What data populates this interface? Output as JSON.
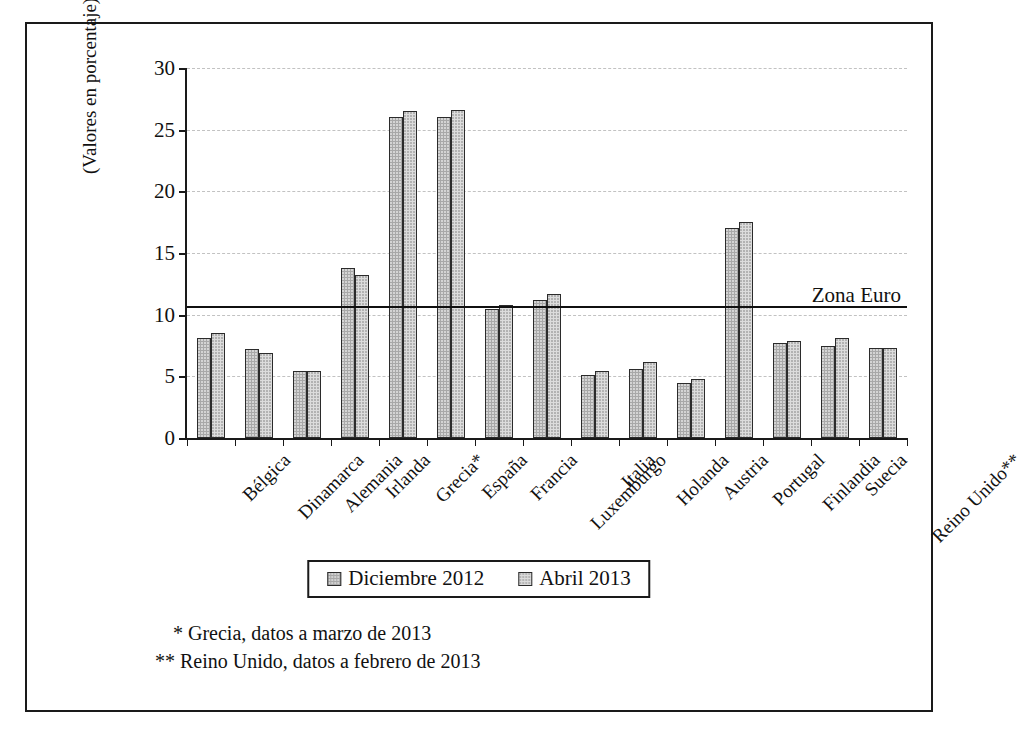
{
  "chart_data": {
    "type": "bar",
    "title": "",
    "xlabel": "",
    "ylabel": "(Valores en porcentaje)",
    "ylim": [
      0,
      30
    ],
    "yticks": [
      0,
      5,
      10,
      15,
      20,
      25,
      30
    ],
    "grid": true,
    "legend_position": "bottom-center",
    "categories": [
      "Bélgica",
      "Dinamarca",
      "Alemania",
      "Irlanda",
      "Grecia*",
      "España",
      "Francia",
      "Luxemburgo",
      "Italia",
      "Holanda",
      "Austria",
      "Portugal",
      "Finlandia",
      "Suecia",
      "Reino Unido**"
    ],
    "series": [
      {
        "name": "Diciembre 2012",
        "color": "#a8a8a8",
        "values": [
          8.1,
          7.2,
          5.4,
          13.8,
          26.0,
          26.0,
          10.5,
          11.2,
          5.1,
          5.6,
          4.5,
          17.0,
          7.7,
          7.5,
          7.3
        ]
      },
      {
        "name": "Abril 2013",
        "color": "#dcdcdc",
        "values": [
          8.5,
          6.9,
          5.4,
          13.2,
          26.5,
          26.6,
          10.8,
          11.7,
          5.4,
          6.2,
          4.8,
          17.5,
          7.9,
          8.1,
          7.3
        ]
      }
    ],
    "reference_line": {
      "label": "Zona Euro",
      "value": 10.7
    },
    "annotations": [
      "* Grecia, datos a marzo de 2013",
      "** Reino Unido, datos a febrero de 2013"
    ]
  },
  "axis": {
    "y_title": "(Valores en porcentaje)"
  },
  "legend": {
    "items": [
      {
        "label": "Diciembre 2012"
      },
      {
        "label": "Abril 2013"
      }
    ]
  },
  "reference": {
    "label": "Zona Euro"
  },
  "footnotes": {
    "line1": "* Grecia, datos a marzo de 2013",
    "line2": "** Reino Unido, datos a febrero de 2013"
  }
}
